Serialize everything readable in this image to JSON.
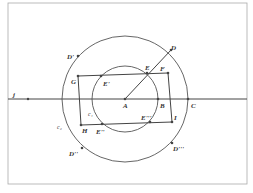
{
  "diagram": {
    "frame": {
      "x": 8,
      "y": 3,
      "w": 239,
      "h": 181
    },
    "line_j": {
      "label": "j",
      "y": 99
    },
    "center": {
      "label": "A",
      "x": 125,
      "y": 99
    },
    "circle_outer": {
      "label": "c₂",
      "r": 63
    },
    "circle_inner": {
      "label": "c₁",
      "r": 33
    },
    "points": {
      "A": "A",
      "B": "B",
      "C": "C",
      "D": "D",
      "D1": "D'",
      "D2": "D''",
      "D3": "D'''",
      "E": "E",
      "E1": "E'",
      "E2": "E''",
      "E3": "E'''",
      "F": "F",
      "G": "G",
      "H": "H",
      "I": "I",
      "j": "j",
      "c1": "c₁",
      "c2": "c₂"
    },
    "rectangle": {
      "vertices": [
        "G",
        "F",
        "I",
        "H"
      ]
    },
    "colors": {
      "stroke": "#444444",
      "frame": "#aaaaaa",
      "background": "#ffffff"
    }
  }
}
